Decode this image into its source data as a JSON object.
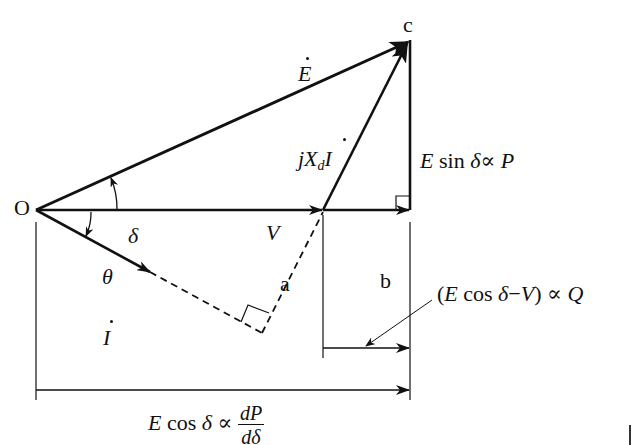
{
  "diagram": {
    "type": "phasor-diagram",
    "points": {
      "origin": "O",
      "a": "a",
      "b": "b",
      "c": "c"
    },
    "vectors": {
      "E": {
        "label": "E",
        "dotted": true,
        "from": "O",
        "to": "c"
      },
      "V": {
        "label": "V",
        "from": "O",
        "to": "a"
      },
      "I": {
        "label": "I",
        "dotted": true,
        "from": "O",
        "direction": "lagging by theta"
      },
      "jXdI": {
        "prefix": "jX",
        "subscript": "d",
        "suffix": "I",
        "dotted": true,
        "from": "a",
        "to": "c"
      }
    },
    "angles": {
      "delta": "δ",
      "theta": "θ"
    },
    "annotations": {
      "e_sin": {
        "E": "E",
        "func": " sin ",
        "sym": "δ",
        "prop": "∝",
        "rhs": "P"
      },
      "e_cos_minus_v": {
        "open": "(",
        "E": "E",
        "func": " cos ",
        "sym": "δ",
        "minus": "−",
        "V": "V",
        "close": ")",
        "prop": " ∝ ",
        "rhs": "Q"
      },
      "e_cos": {
        "E": "E",
        "func": " cos ",
        "sym": "δ",
        "prop": " ∝ ",
        "num": "dP",
        "den": "dδ"
      }
    },
    "colors": {
      "stroke": "#111111",
      "background": "#ffffff"
    }
  }
}
